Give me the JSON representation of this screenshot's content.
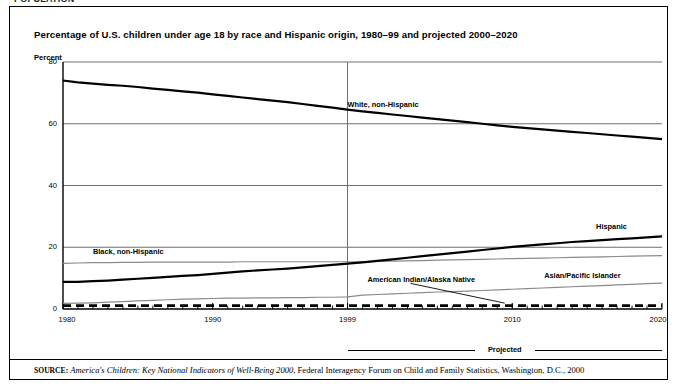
{
  "clipped_header_text": "POPULATION",
  "figure": {
    "title": "Percentage of U.S. children under age 18 by race and Hispanic origin, 1980–99 and projected 2000–2020",
    "axis_unit_label": "Percent",
    "projected_label": "Projected",
    "source": {
      "keyword": "SOURCE:",
      "italic_part": "America's Children: Key National Indicators of Well-Being 2000",
      "rest": ", Federal Interagency Forum on Child and Family Statistics, Washington, D.C., 2000"
    }
  },
  "chart_data": {
    "type": "line",
    "title": "Percentage of U.S. children under age 18 by race and Hispanic origin, 1980–99 and projected 2000–2020",
    "xlabel": "",
    "ylabel": "Percent",
    "xlim": [
      1980,
      2020
    ],
    "ylim": [
      0,
      80
    ],
    "yticks": [
      0,
      20,
      40,
      60,
      80
    ],
    "xticks": [
      1980,
      1990,
      1999,
      2010,
      2020
    ],
    "grid": true,
    "legend": "inline-labels",
    "annotations": [
      {
        "text": "Projected",
        "x_range": [
          1999,
          2020
        ],
        "position": "below-axis"
      },
      {
        "text": "1999 divider",
        "x": 1999,
        "type": "vertical-line"
      }
    ],
    "x": [
      1980,
      1981,
      1982,
      1983,
      1984,
      1985,
      1986,
      1987,
      1988,
      1989,
      1990,
      1991,
      1992,
      1993,
      1994,
      1995,
      1996,
      1997,
      1998,
      1999,
      2000,
      2001,
      2002,
      2003,
      2004,
      2005,
      2006,
      2007,
      2008,
      2009,
      2010,
      2011,
      2012,
      2013,
      2014,
      2015,
      2016,
      2017,
      2018,
      2019,
      2020
    ],
    "series": [
      {
        "name": "White, non-Hispanic",
        "style": "thick-black",
        "label_x": 1999,
        "label_y": 66,
        "values": [
          74.0,
          73.4,
          73.0,
          72.6,
          72.3,
          71.9,
          71.4,
          71.0,
          70.5,
          70.1,
          69.5,
          69.0,
          68.5,
          68.0,
          67.5,
          67.0,
          66.4,
          65.8,
          65.2,
          64.6,
          64.0,
          63.5,
          63.0,
          62.5,
          62.0,
          61.5,
          61.0,
          60.5,
          60.0,
          59.5,
          59.0,
          58.6,
          58.2,
          57.8,
          57.4,
          57.0,
          56.6,
          56.2,
          55.8,
          55.4,
          55.0
        ]
      },
      {
        "name": "Black, non-Hispanic",
        "style": "thin-gray",
        "label_x": 1982,
        "label_y": 18.5,
        "values": [
          14.8,
          14.9,
          15.0,
          15.0,
          15.1,
          15.1,
          15.2,
          15.2,
          15.2,
          15.2,
          15.2,
          15.2,
          15.3,
          15.3,
          15.3,
          15.3,
          15.3,
          15.3,
          15.3,
          15.3,
          15.3,
          15.4,
          15.5,
          15.6,
          15.7,
          15.8,
          15.9,
          16.0,
          16.1,
          16.2,
          16.3,
          16.4,
          16.5,
          16.6,
          16.7,
          16.8,
          16.9,
          17.0,
          17.1,
          17.2,
          17.3
        ]
      },
      {
        "name": "Hispanic",
        "style": "thick-black",
        "label_x": 2016,
        "label_y": 26.5,
        "values": [
          8.8,
          8.8,
          9.0,
          9.2,
          9.5,
          9.8,
          10.1,
          10.4,
          10.7,
          11.0,
          11.4,
          11.8,
          12.2,
          12.5,
          12.8,
          13.1,
          13.5,
          13.9,
          14.3,
          14.7,
          15.1,
          15.6,
          16.1,
          16.6,
          17.1,
          17.6,
          18.1,
          18.6,
          19.1,
          19.6,
          20.1,
          20.5,
          20.9,
          21.3,
          21.7,
          22.0,
          22.3,
          22.6,
          22.9,
          23.2,
          23.5
        ]
      },
      {
        "name": "Asian/Pacific Islander",
        "style": "thin-gray",
        "label_x": 2014,
        "label_y": 10.8,
        "values": [
          1.8,
          1.9,
          2.0,
          2.2,
          2.4,
          2.6,
          2.8,
          3.0,
          3.2,
          3.3,
          3.4,
          3.5,
          3.5,
          3.6,
          3.6,
          3.7,
          3.7,
          3.8,
          3.8,
          3.9,
          4.5,
          4.7,
          4.9,
          5.1,
          5.3,
          5.5,
          5.6,
          5.8,
          6.0,
          6.2,
          6.4,
          6.6,
          6.8,
          7.0,
          7.2,
          7.4,
          7.6,
          7.8,
          8.0,
          8.2,
          8.4
        ]
      },
      {
        "name": "American Indian/Alaska Native",
        "style": "thick-dashed-black",
        "label_x": 2003,
        "label_y": 9.5,
        "values": [
          1.1,
          1.1,
          1.1,
          1.1,
          1.1,
          1.1,
          1.1,
          1.1,
          1.1,
          1.1,
          1.1,
          1.1,
          1.1,
          1.1,
          1.1,
          1.1,
          1.1,
          1.1,
          1.1,
          1.1,
          1.1,
          1.1,
          1.1,
          1.1,
          1.1,
          1.1,
          1.1,
          1.1,
          1.1,
          1.1,
          1.1,
          1.1,
          1.1,
          1.1,
          1.1,
          1.1,
          1.1,
          1.1,
          1.1,
          1.1,
          1.1
        ]
      }
    ]
  }
}
